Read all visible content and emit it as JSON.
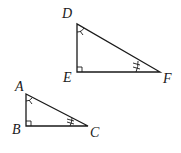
{
  "figure": {
    "triangles": [
      {
        "name": "DEF",
        "vertices": {
          "D": {
            "label": "D",
            "x": 77,
            "y": 24
          },
          "E": {
            "label": "E",
            "x": 77,
            "y": 72
          },
          "F": {
            "label": "F",
            "x": 160,
            "y": 72
          }
        },
        "right_angle_at": "E",
        "single_arc_at": "D",
        "double_tick_at": "F"
      },
      {
        "name": "ABC",
        "vertices": {
          "A": {
            "label": "A",
            "x": 26,
            "y": 94
          },
          "B": {
            "label": "B",
            "x": 26,
            "y": 126
          },
          "C": {
            "label": "C",
            "x": 88,
            "y": 126
          }
        },
        "right_angle_at": "B",
        "single_arc_at": "A",
        "double_tick_at": "C"
      }
    ],
    "labels": {
      "D": "D",
      "E": "E",
      "F": "F",
      "A": "A",
      "B": "B",
      "C": "C"
    },
    "colors": {
      "stroke": "#1a1a1a",
      "background": "#ffffff"
    }
  }
}
